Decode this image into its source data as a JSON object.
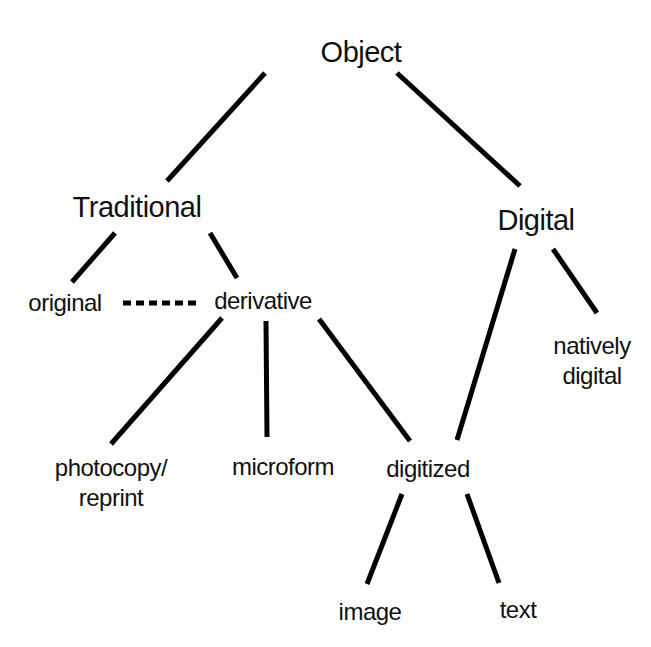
{
  "diagram": {
    "type": "tree",
    "nodes": {
      "object": "Object",
      "traditional": "Traditional",
      "digital": "Digital",
      "original": "original",
      "derivative": "derivative",
      "natively_digital_line1": "natively",
      "natively_digital_line2": "digital",
      "photocopy_line1": "photocopy/",
      "photocopy_line2": "reprint",
      "microform": "microform",
      "digitized": "digitized",
      "image": "image",
      "text": "text"
    },
    "edges": [
      {
        "from": "Object",
        "to": "Traditional",
        "style": "solid"
      },
      {
        "from": "Object",
        "to": "Digital",
        "style": "solid"
      },
      {
        "from": "Traditional",
        "to": "original",
        "style": "solid"
      },
      {
        "from": "Traditional",
        "to": "derivative",
        "style": "solid"
      },
      {
        "from": "original",
        "to": "derivative",
        "style": "dashed"
      },
      {
        "from": "Digital",
        "to": "digitized",
        "style": "solid"
      },
      {
        "from": "Digital",
        "to": "natively digital",
        "style": "solid"
      },
      {
        "from": "derivative",
        "to": "photocopy/reprint",
        "style": "solid"
      },
      {
        "from": "derivative",
        "to": "microform",
        "style": "solid"
      },
      {
        "from": "derivative",
        "to": "digitized",
        "style": "solid"
      },
      {
        "from": "digitized",
        "to": "image",
        "style": "solid"
      },
      {
        "from": "digitized",
        "to": "text",
        "style": "solid"
      }
    ]
  }
}
